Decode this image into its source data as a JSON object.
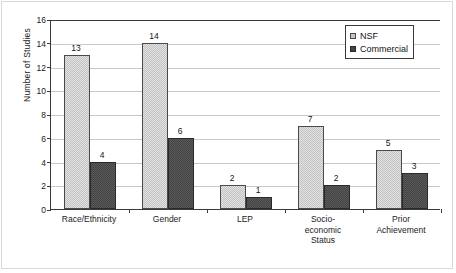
{
  "chart_data": {
    "type": "bar",
    "title": "",
    "xlabel": "",
    "ylabel": "Number of Studies",
    "ylim": [
      0,
      16
    ],
    "ytick_labels": [
      "0",
      "2",
      "4",
      "6",
      "8",
      "10",
      "12",
      "14",
      "16"
    ],
    "ytick_values": [
      0,
      2,
      4,
      6,
      8,
      10,
      12,
      14,
      16
    ],
    "grid": true,
    "grid_axis": "y",
    "legend_position": "top-right",
    "categories": [
      "Race/Ethnicity",
      "Gender",
      "LEP",
      "Socio-\neconomic\nStatus",
      "Prior\nAchievement"
    ],
    "series": [
      {
        "name": "NSF",
        "color": "#c2c2c2",
        "values": [
          13,
          14,
          2,
          7,
          5
        ],
        "labels": [
          "13",
          "14",
          "2",
          "7",
          "5"
        ]
      },
      {
        "name": "Commercial",
        "color": "#434343",
        "values": [
          4,
          6,
          1,
          2,
          3
        ],
        "labels": [
          "4",
          "6",
          "1",
          "2",
          "3"
        ]
      }
    ]
  },
  "legend": {
    "items": [
      {
        "label": "NSF",
        "swatch": "nsf"
      },
      {
        "label": "Commercial",
        "swatch": "commercial"
      }
    ]
  }
}
